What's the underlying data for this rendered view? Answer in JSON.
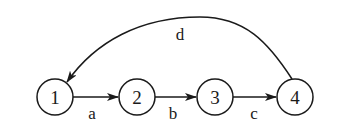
{
  "diagram": {
    "type": "directed-graph",
    "colors": {
      "stroke": "#1a1a1a",
      "background": "#ffffff"
    },
    "nodes": [
      {
        "id": "1",
        "label": "1",
        "cx": 55,
        "cy": 97,
        "r": 18
      },
      {
        "id": "2",
        "label": "2",
        "cx": 137,
        "cy": 97,
        "r": 18
      },
      {
        "id": "3",
        "label": "3",
        "cx": 215,
        "cy": 97,
        "r": 18
      },
      {
        "id": "4",
        "label": "4",
        "cx": 295,
        "cy": 97,
        "r": 18
      }
    ],
    "edges": [
      {
        "from": "1",
        "to": "2",
        "label": "a"
      },
      {
        "from": "2",
        "to": "3",
        "label": "b"
      },
      {
        "from": "3",
        "to": "4",
        "label": "c"
      },
      {
        "from": "4",
        "to": "1",
        "label": "d",
        "curved": true
      }
    ]
  }
}
